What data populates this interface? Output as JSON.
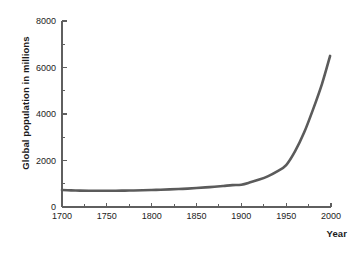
{
  "chart_data": {
    "type": "line",
    "title": "",
    "subtitle": "",
    "xlabel": "Year",
    "ylabel": "Global population in millions",
    "xlim": [
      1700,
      2000
    ],
    "ylim": [
      0,
      8000
    ],
    "grid": false,
    "legend": null,
    "legend_position": "none",
    "x_ticks": [
      1700,
      1750,
      1800,
      1850,
      1900,
      1950,
      2000
    ],
    "x_tick_labels": [
      "1700",
      "1750",
      "1800",
      "1850",
      "1900",
      "1950",
      "2000"
    ],
    "x_minor_ticks": [
      1725,
      1775,
      1825,
      1875,
      1925,
      1975
    ],
    "y_ticks": [
      0,
      2000,
      4000,
      6000,
      8000
    ],
    "y_tick_labels": [
      "0",
      "2000",
      "4000",
      "6000",
      "8000"
    ],
    "y_minor_ticks": [
      1000,
      3000,
      5000,
      7000
    ],
    "series": [
      {
        "name": "Global population",
        "color": "#5b5b5b",
        "line_width": 2.6,
        "x": [
          1700,
          1710,
          1720,
          1730,
          1740,
          1750,
          1760,
          1770,
          1780,
          1790,
          1800,
          1810,
          1820,
          1830,
          1840,
          1850,
          1860,
          1870,
          1880,
          1890,
          1900,
          1910,
          1920,
          1930,
          1940,
          1950,
          1960,
          1970,
          1980,
          1990,
          1999
        ],
        "values": [
          730,
          715,
          705,
          700,
          700,
          700,
          702,
          706,
          712,
          720,
          730,
          742,
          756,
          772,
          792,
          815,
          842,
          872,
          905,
          940,
          960,
          1060,
          1180,
          1330,
          1530,
          1800,
          2400,
          3200,
          4200,
          5300,
          6500
        ]
      }
    ]
  }
}
